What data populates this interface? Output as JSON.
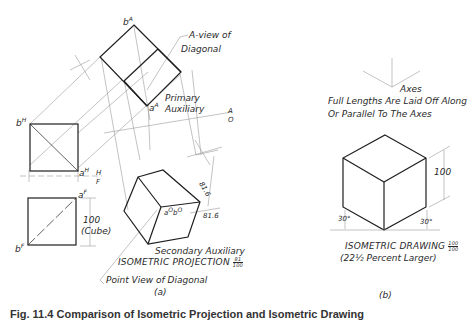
{
  "figure": {
    "caption": "Fig. 11.4 Comparison of Isometric Projection and Isometric Drawing",
    "panel_a": {
      "label": "(a)",
      "labels": {
        "b_A": "b",
        "b_A_sup": "A",
        "a_A": "a",
        "a_A_sup": "A",
        "b_H": "b",
        "b_H_sup": "H",
        "a_H": "a",
        "a_H_sup": "H",
        "a_F": "a",
        "a_F_sup": "F",
        "b_F": "b",
        "b_F_sup": "F",
        "ab_O": "a",
        "ab_O_sup1": "O",
        "ab_O_b": "b",
        "ab_O_sup2": "O",
        "fold_H": "H",
        "fold_F": "F",
        "fold_A": "A",
        "fold_O": "O"
      },
      "notes": {
        "a_view_line1": "A-view of",
        "a_view_line2": "Diagonal",
        "primary_line1": "Primary",
        "primary_line2": "Auxiliary",
        "cube_dim": "100",
        "cube_note": "(Cube)",
        "dim_top": "81.6",
        "dim_side": "81.6",
        "secondary": "Secondary Auxiliary",
        "iso_projection": "ISOMETRIC PROJECTION",
        "iso_projection_frac_num": "81",
        "iso_projection_frac_den": "100",
        "point_view": "Point View of Diagonal"
      }
    },
    "panel_b": {
      "label": "(b)",
      "axes": "Axes",
      "axes_note_line1": "Full Lengths Are Laid Off Along",
      "axes_note_line2": "Or Parallel To The Axes",
      "dim": "100",
      "angle_left": "30°",
      "angle_right": "30°",
      "iso_drawing": "ISOMETRIC DRAWING",
      "iso_drawing_frac_num": "100",
      "iso_drawing_frac_den": "100",
      "percent_note": "(22½ Percent Larger)"
    },
    "colors": {
      "ink": "#1e1e1e",
      "thin": "#8a8a8a",
      "background": "#ffffff"
    }
  }
}
